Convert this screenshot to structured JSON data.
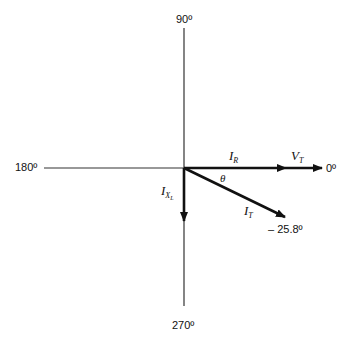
{
  "diagram": {
    "type": "phasor-diagram",
    "axes": {
      "top_label": "90º",
      "left_label": "180º",
      "right_label": "0º",
      "bottom_label": "270º"
    },
    "vectors": {
      "resistive_current": {
        "symbol": "I",
        "subscript": "R",
        "angle_deg": 0
      },
      "total_voltage": {
        "symbol": "V",
        "subscript": "T",
        "angle_deg": 0
      },
      "inductive_current": {
        "symbol": "I",
        "subscript": "X",
        "sub_subscript": "L",
        "angle_deg": -90
      },
      "total_current": {
        "symbol": "I",
        "subscript": "T",
        "angle_deg": -25.8
      }
    },
    "angle_label": "θ",
    "total_current_angle_label": "– 25.8º",
    "colors": {
      "background": "#ffffff",
      "axis": "#333333",
      "vector": "#111111"
    }
  }
}
